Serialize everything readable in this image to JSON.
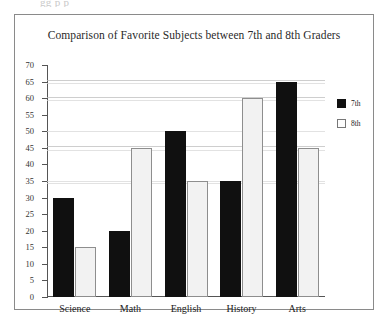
{
  "scan_artifact_text": "gg p  p",
  "chart_data": {
    "type": "bar",
    "title": "Comparison of Favorite Subjects between 7th and 8th Graders",
    "xlabel": "",
    "ylabel": "",
    "ylim": [
      0,
      70
    ],
    "ytick_step": 5,
    "yticks": [
      70,
      65,
      60,
      55,
      50,
      45,
      40,
      35,
      30,
      25,
      20,
      15,
      10,
      5,
      0
    ],
    "categories": [
      "Science",
      "Math",
      "English",
      "History",
      "Arts"
    ],
    "series": [
      {
        "name": "7th",
        "color": "#101010",
        "values": [
          30,
          20,
          50,
          35,
          65
        ]
      },
      {
        "name": "8th",
        "color": "#f2f2f2",
        "values": [
          15,
          45,
          35,
          60,
          45
        ]
      }
    ],
    "legend": {
      "position": "right",
      "entries": [
        {
          "label": "7th",
          "swatch": "filled-black-square"
        },
        {
          "label": "8th",
          "swatch": "outlined-white-square"
        }
      ]
    },
    "grid": false
  }
}
